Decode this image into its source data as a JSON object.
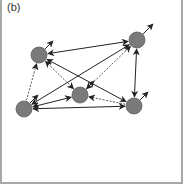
{
  "panel": {
    "label": "(b)"
  },
  "colors": {
    "node_fill": "#7a7a7a",
    "node_stroke": "#5e5e5e",
    "edge_solid": "#222222",
    "edge_dashed": "#555555",
    "frame": "#a8a8a8"
  },
  "nodes": [
    {
      "id": "A",
      "x": 39,
      "y": 55,
      "r": 8
    },
    {
      "id": "B",
      "x": 137,
      "y": 40,
      "r": 8
    },
    {
      "id": "C",
      "x": 80,
      "y": 95,
      "r": 8
    },
    {
      "id": "D",
      "x": 24,
      "y": 109,
      "r": 8
    },
    {
      "id": "E",
      "x": 134,
      "y": 106,
      "r": 8
    }
  ],
  "edges": [
    {
      "from": "A",
      "to": "B",
      "style": "solid",
      "direction": "both"
    },
    {
      "from": "A",
      "to": "E",
      "style": "solid",
      "direction": "both"
    },
    {
      "from": "A",
      "to": "C",
      "style": "dashed",
      "direction": "both"
    },
    {
      "from": "D",
      "to": "A",
      "style": "dashed",
      "direction": "forward"
    },
    {
      "from": "D",
      "to": "B",
      "style": "solid",
      "direction": "both"
    },
    {
      "from": "D",
      "to": "C",
      "style": "solid",
      "direction": "both"
    },
    {
      "from": "D",
      "to": "E",
      "style": "solid",
      "direction": "both"
    },
    {
      "from": "C",
      "to": "B",
      "style": "dashed",
      "direction": "both"
    },
    {
      "from": "E",
      "to": "C",
      "style": "dashed",
      "direction": "forward"
    },
    {
      "from": "B",
      "to": "E",
      "style": "solid",
      "direction": "both"
    }
  ],
  "outgoing_stubs": [
    {
      "node": "A",
      "dx": 14,
      "dy": -14
    },
    {
      "node": "B",
      "dx": 16,
      "dy": -16
    },
    {
      "node": "C",
      "dx": 14,
      "dy": -14
    },
    {
      "node": "D",
      "dx": 14,
      "dy": -14
    },
    {
      "node": "E",
      "dx": 14,
      "dy": -14
    }
  ]
}
